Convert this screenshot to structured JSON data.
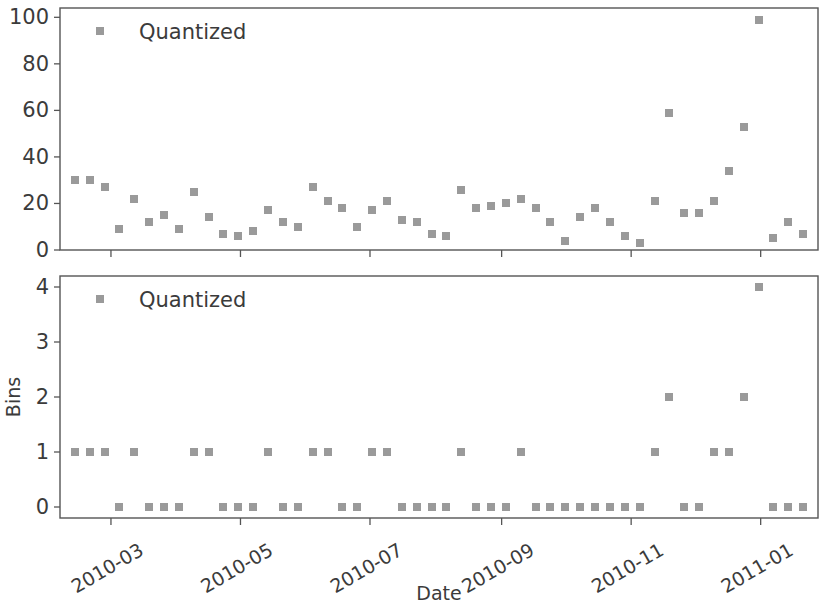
{
  "figure": {
    "width": 822,
    "height": 606,
    "background": "#ffffff",
    "marker_color": "#9a9a9a",
    "axis_color": "#555555",
    "text_color": "#3b3b3b"
  },
  "xaxis": {
    "label": "Date",
    "tick_labels": [
      "2010-03",
      "2010-05",
      "2010-07",
      "2010-09",
      "2010-11",
      "2011-01"
    ],
    "tick_rotation": -30
  },
  "panels": [
    {
      "id": "top-panel",
      "ylabel": "",
      "ylim": [
        0,
        104
      ],
      "yticks": [
        0,
        20,
        40,
        60,
        80,
        100
      ],
      "legend_label": "Quantized"
    },
    {
      "id": "bottom-panel",
      "ylabel": "Bins",
      "ylim": [
        -0.2,
        4.2
      ],
      "yticks": [
        0,
        1,
        2,
        3,
        4
      ],
      "legend_label": "Quantized"
    }
  ],
  "chart_data": [
    {
      "type": "scatter",
      "title": "",
      "xlabel": "Date",
      "ylabel": "",
      "ylim": [
        0,
        104
      ],
      "yticks": [
        0,
        20,
        40,
        60,
        80,
        100
      ],
      "xtick_labels": [
        "2010-03",
        "2010-05",
        "2010-07",
        "2010-09",
        "2010-11",
        "2011-01"
      ],
      "grid": false,
      "legend_position": "upper left",
      "series": [
        {
          "name": "Quantized",
          "marker": "square",
          "color": "#9a9a9a",
          "x": [
            "2010-02-12",
            "2010-02-19",
            "2010-02-26",
            "2010-03-05",
            "2010-03-12",
            "2010-03-19",
            "2010-03-26",
            "2010-04-02",
            "2010-04-09",
            "2010-04-16",
            "2010-04-23",
            "2010-04-30",
            "2010-05-07",
            "2010-05-14",
            "2010-05-21",
            "2010-05-28",
            "2010-06-04",
            "2010-06-11",
            "2010-06-18",
            "2010-06-25",
            "2010-07-02",
            "2010-07-09",
            "2010-07-16",
            "2010-07-23",
            "2010-07-30",
            "2010-08-06",
            "2010-08-13",
            "2010-08-20",
            "2010-08-27",
            "2010-09-03",
            "2010-09-10",
            "2010-09-17",
            "2010-09-24",
            "2010-10-01",
            "2010-10-08",
            "2010-10-15",
            "2010-10-22",
            "2010-10-29",
            "2010-11-05",
            "2010-11-12",
            "2010-11-19",
            "2010-11-26",
            "2010-12-03",
            "2010-12-10",
            "2010-12-17",
            "2010-12-24",
            "2010-12-31",
            "2011-01-07",
            "2011-01-14",
            "2011-01-21"
          ],
          "y": [
            30,
            30,
            27,
            9,
            22,
            12,
            15,
            9,
            25,
            14,
            7,
            6,
            8,
            17,
            12,
            10,
            27,
            21,
            18,
            10,
            17,
            21,
            13,
            12,
            7,
            6,
            26,
            18,
            19,
            20,
            22,
            18,
            12,
            4,
            14,
            18,
            12,
            6,
            3,
            21,
            59,
            16,
            16,
            21,
            34,
            53,
            99,
            5,
            12,
            7
          ]
        }
      ]
    },
    {
      "type": "scatter",
      "title": "",
      "xlabel": "Date",
      "ylabel": "Bins",
      "ylim": [
        -0.2,
        4.2
      ],
      "yticks": [
        0,
        1,
        2,
        3,
        4
      ],
      "xtick_labels": [
        "2010-03",
        "2010-05",
        "2010-07",
        "2010-09",
        "2010-11",
        "2011-01"
      ],
      "grid": false,
      "legend_position": "upper left",
      "series": [
        {
          "name": "Quantized",
          "marker": "square",
          "color": "#9a9a9a",
          "x": [
            "2010-02-12",
            "2010-02-19",
            "2010-02-26",
            "2010-03-05",
            "2010-03-12",
            "2010-03-19",
            "2010-03-26",
            "2010-04-02",
            "2010-04-09",
            "2010-04-16",
            "2010-04-23",
            "2010-04-30",
            "2010-05-07",
            "2010-05-14",
            "2010-05-21",
            "2010-05-28",
            "2010-06-04",
            "2010-06-11",
            "2010-06-18",
            "2010-06-25",
            "2010-07-02",
            "2010-07-09",
            "2010-07-16",
            "2010-07-23",
            "2010-07-30",
            "2010-08-06",
            "2010-08-13",
            "2010-08-20",
            "2010-08-27",
            "2010-09-03",
            "2010-09-10",
            "2010-09-17",
            "2010-09-24",
            "2010-10-01",
            "2010-10-08",
            "2010-10-15",
            "2010-10-22",
            "2010-10-29",
            "2010-11-05",
            "2010-11-12",
            "2010-11-19",
            "2010-11-26",
            "2010-12-03",
            "2010-12-10",
            "2010-12-17",
            "2010-12-24",
            "2010-12-31",
            "2011-01-07",
            "2011-01-14",
            "2011-01-21"
          ],
          "y": [
            1,
            1,
            1,
            0,
            1,
            0,
            0,
            0,
            1,
            1,
            0,
            0,
            0,
            1,
            0,
            0,
            1,
            1,
            0,
            0,
            1,
            1,
            0,
            0,
            0,
            0,
            1,
            0,
            0,
            0,
            1,
            0,
            0,
            0,
            0,
            0,
            0,
            0,
            0,
            1,
            2,
            0,
            0,
            1,
            1,
            2,
            4,
            0,
            0,
            0
          ]
        }
      ]
    }
  ]
}
